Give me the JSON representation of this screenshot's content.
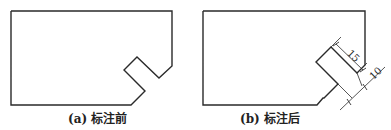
{
  "figures": [
    {
      "id": "a",
      "caption": "(a) 标注前",
      "outline_points": "11,11 172,11 172,66 159,78 137,57 124,70 145,91 131,105 11,105"
    },
    {
      "id": "b",
      "caption": "(b) 标注后",
      "outline_points": "203,11 365,11 365,67 357,76 330,49 317,62 338,83 325,95 324,96 323,97 317,105 203,105",
      "dimensions": [
        {
          "label": "15"
        },
        {
          "label": "10"
        }
      ]
    }
  ],
  "colors": {
    "line": "#2a2a2a",
    "background": "#ffffff"
  }
}
